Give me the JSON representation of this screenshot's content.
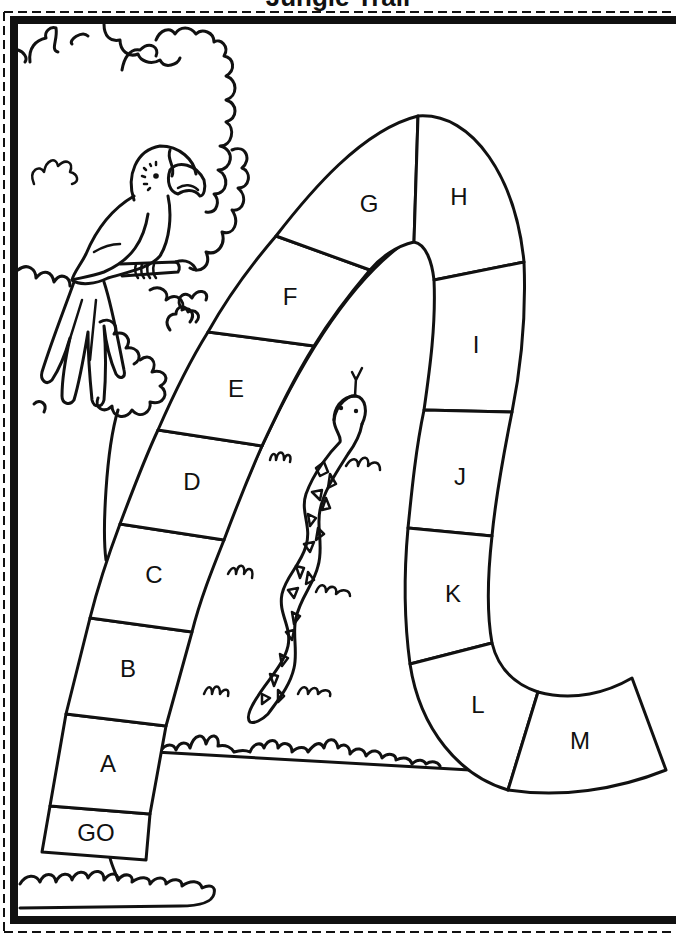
{
  "header": {
    "title": "Jungle Trail"
  },
  "colors": {
    "ink": "#111111",
    "paper": "#ffffff"
  },
  "board": {
    "start_label": "GO",
    "spaces": [
      {
        "id": "go",
        "label": "GO"
      },
      {
        "id": "a",
        "label": "A"
      },
      {
        "id": "b",
        "label": "B"
      },
      {
        "id": "c",
        "label": "C"
      },
      {
        "id": "d",
        "label": "D"
      },
      {
        "id": "e",
        "label": "E"
      },
      {
        "id": "f",
        "label": "F"
      },
      {
        "id": "g",
        "label": "G"
      },
      {
        "id": "h",
        "label": "H"
      },
      {
        "id": "i",
        "label": "I"
      },
      {
        "id": "j",
        "label": "J"
      },
      {
        "id": "k",
        "label": "K"
      },
      {
        "id": "l",
        "label": "L"
      },
      {
        "id": "m",
        "label": "M"
      }
    ]
  },
  "illustrations": {
    "bird": "bird-icon",
    "snake": "snake-icon",
    "tree": "tree-icon",
    "grass": "grass-icon"
  }
}
